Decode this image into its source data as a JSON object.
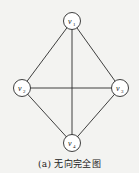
{
  "diagram": {
    "type": "undirected-complete-graph",
    "caption": "(a) 无向完全图",
    "colors": {
      "background": "#f3f3f1",
      "stroke": "#2a2a2a",
      "node_fill": "#ffffff",
      "text": "#1a1a1a"
    },
    "nodes": [
      {
        "id": "v1",
        "label": "v",
        "sub": "1",
        "x": 72,
        "y": 21
      },
      {
        "id": "v2",
        "label": "v",
        "sub": "2",
        "x": 22,
        "y": 88
      },
      {
        "id": "v3",
        "label": "v",
        "sub": "3",
        "x": 120,
        "y": 88
      },
      {
        "id": "v4",
        "label": "v",
        "sub": "4",
        "x": 72,
        "y": 143
      }
    ],
    "edges": [
      [
        "v1",
        "v2"
      ],
      [
        "v1",
        "v3"
      ],
      [
        "v1",
        "v4"
      ],
      [
        "v2",
        "v3"
      ],
      [
        "v2",
        "v4"
      ],
      [
        "v3",
        "v4"
      ]
    ]
  }
}
